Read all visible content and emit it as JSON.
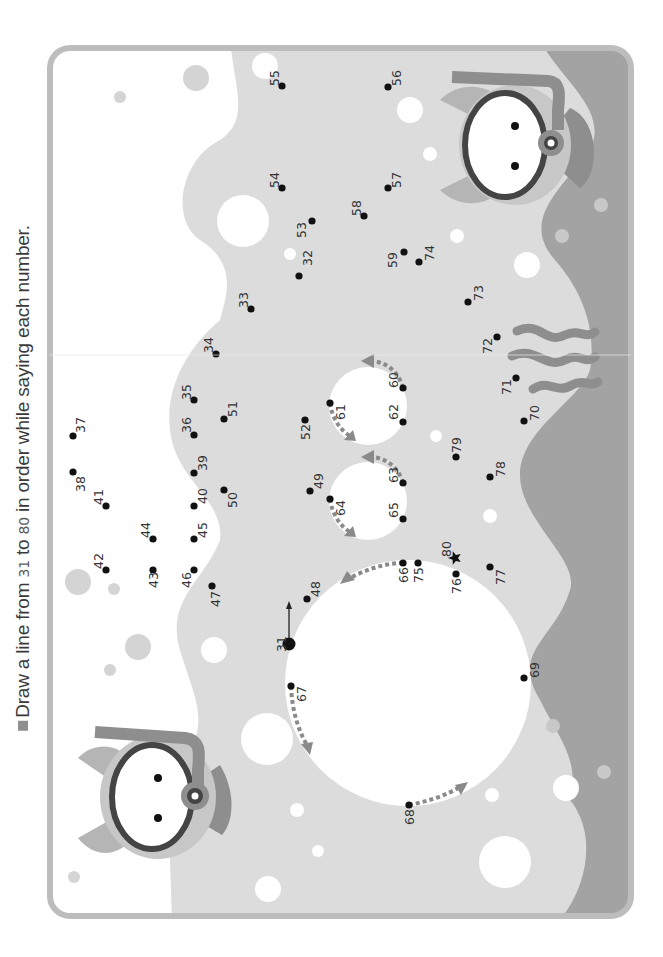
{
  "instruction": {
    "prefix": "Draw a line from ",
    "start": "31",
    "middle": " to ",
    "end": "80",
    "suffix": " in order while saying each number."
  },
  "colors": {
    "frame": "#bdbdbd",
    "water_light": "#dcdcdc",
    "water_dark": "#a3a3a3",
    "bubble_white": "#ffffff",
    "bubble_gray": "#d4d4d4",
    "dot": "#111111",
    "arrow_gray": "#8a8a8a"
  },
  "start_dot": "31",
  "end_marker": "80",
  "dots": [
    {
      "n": "31",
      "x": 289,
      "y": 644,
      "lx": 281,
      "ly": 644,
      "big": true
    },
    {
      "n": "32",
      "x": 299,
      "y": 276,
      "lx": 307,
      "ly": 258
    },
    {
      "n": "33",
      "x": 251,
      "y": 309,
      "lx": 243,
      "ly": 300
    },
    {
      "n": "34",
      "x": 216,
      "y": 354,
      "lx": 208,
      "ly": 345
    },
    {
      "n": "35",
      "x": 194,
      "y": 400,
      "lx": 186,
      "ly": 392
    },
    {
      "n": "36",
      "x": 194,
      "y": 435,
      "lx": 186,
      "ly": 425
    },
    {
      "n": "37",
      "x": 73,
      "y": 436,
      "lx": 80,
      "ly": 425
    },
    {
      "n": "38",
      "x": 73,
      "y": 472,
      "lx": 80,
      "ly": 484
    },
    {
      "n": "39",
      "x": 194,
      "y": 473,
      "lx": 202,
      "ly": 463
    },
    {
      "n": "40",
      "x": 194,
      "y": 506,
      "lx": 202,
      "ly": 496
    },
    {
      "n": "41",
      "x": 106,
      "y": 506,
      "lx": 98,
      "ly": 497
    },
    {
      "n": "42",
      "x": 106,
      "y": 570,
      "lx": 98,
      "ly": 561
    },
    {
      "n": "43",
      "x": 153,
      "y": 570,
      "lx": 153,
      "ly": 580
    },
    {
      "n": "44",
      "x": 153,
      "y": 539,
      "lx": 145,
      "ly": 530
    },
    {
      "n": "45",
      "x": 194,
      "y": 539,
      "lx": 202,
      "ly": 530
    },
    {
      "n": "46",
      "x": 194,
      "y": 570,
      "lx": 186,
      "ly": 580
    },
    {
      "n": "47",
      "x": 212,
      "y": 586,
      "lx": 215,
      "ly": 599
    },
    {
      "n": "48",
      "x": 307,
      "y": 599,
      "lx": 315,
      "ly": 589
    },
    {
      "n": "49",
      "x": 310,
      "y": 491,
      "lx": 318,
      "ly": 481
    },
    {
      "n": "50",
      "x": 224,
      "y": 490,
      "lx": 232,
      "ly": 500
    },
    {
      "n": "51",
      "x": 224,
      "y": 419,
      "lx": 232,
      "ly": 409
    },
    {
      "n": "52",
      "x": 305,
      "y": 420,
      "lx": 305,
      "ly": 432
    },
    {
      "n": "53",
      "x": 312,
      "y": 221,
      "lx": 301,
      "ly": 230
    },
    {
      "n": "54",
      "x": 282,
      "y": 188,
      "lx": 274,
      "ly": 180
    },
    {
      "n": "55",
      "x": 282,
      "y": 86,
      "lx": 274,
      "ly": 78
    },
    {
      "n": "56",
      "x": 388,
      "y": 87,
      "lx": 396,
      "ly": 78
    },
    {
      "n": "57",
      "x": 388,
      "y": 188,
      "lx": 396,
      "ly": 180
    },
    {
      "n": "58",
      "x": 364,
      "y": 216,
      "lx": 356,
      "ly": 208
    },
    {
      "n": "59",
      "x": 404,
      "y": 252,
      "lx": 392,
      "ly": 260
    },
    {
      "n": "60",
      "x": 403,
      "y": 388,
      "lx": 393,
      "ly": 380
    },
    {
      "n": "61",
      "x": 330,
      "y": 403,
      "lx": 340,
      "ly": 412
    },
    {
      "n": "62",
      "x": 403,
      "y": 422,
      "lx": 393,
      "ly": 412
    },
    {
      "n": "63",
      "x": 403,
      "y": 483,
      "lx": 393,
      "ly": 475
    },
    {
      "n": "64",
      "x": 330,
      "y": 499,
      "lx": 340,
      "ly": 508
    },
    {
      "n": "65",
      "x": 403,
      "y": 519,
      "lx": 393,
      "ly": 510
    },
    {
      "n": "66",
      "x": 403,
      "y": 563,
      "lx": 403,
      "ly": 575
    },
    {
      "n": "67",
      "x": 291,
      "y": 686,
      "lx": 301,
      "ly": 694
    },
    {
      "n": "68",
      "x": 409,
      "y": 805,
      "lx": 409,
      "ly": 817
    },
    {
      "n": "69",
      "x": 524,
      "y": 678,
      "lx": 534,
      "ly": 670
    },
    {
      "n": "70",
      "x": 524,
      "y": 421,
      "lx": 534,
      "ly": 413
    },
    {
      "n": "71",
      "x": 516,
      "y": 378,
      "lx": 506,
      "ly": 387
    },
    {
      "n": "72",
      "x": 497,
      "y": 337,
      "lx": 487,
      "ly": 346
    },
    {
      "n": "73",
      "x": 468,
      "y": 302,
      "lx": 478,
      "ly": 293
    },
    {
      "n": "74",
      "x": 419,
      "y": 262,
      "lx": 429,
      "ly": 253
    },
    {
      "n": "75",
      "x": 418,
      "y": 563,
      "lx": 418,
      "ly": 575
    },
    {
      "n": "76",
      "x": 456,
      "y": 574,
      "lx": 456,
      "ly": 586
    },
    {
      "n": "77",
      "x": 490,
      "y": 567,
      "lx": 500,
      "ly": 577
    },
    {
      "n": "78",
      "x": 490,
      "y": 477,
      "lx": 500,
      "ly": 469
    },
    {
      "n": "79",
      "x": 456,
      "y": 457,
      "lx": 456,
      "ly": 445
    },
    {
      "n": "80",
      "x": 455,
      "y": 558,
      "lx": 446,
      "ly": 549,
      "star": true
    }
  ]
}
